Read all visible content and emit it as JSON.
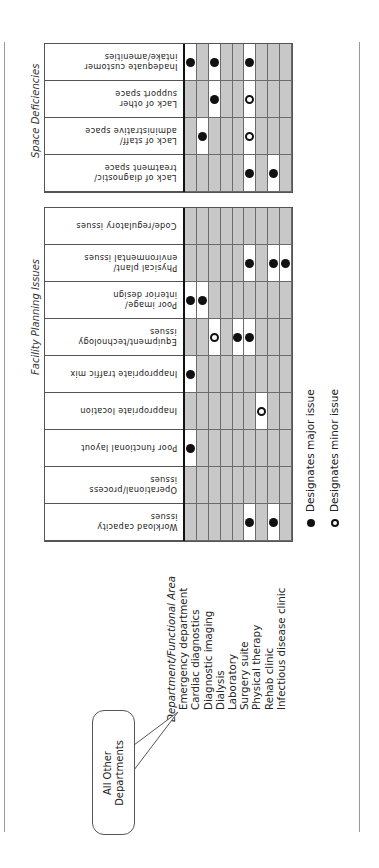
{
  "figure": {
    "dept_header": "Department/Functional Area",
    "departments": [
      "Emergency department",
      "Cardiac diagnostics",
      "Diagnostic imaging",
      "Dialysis",
      "Laboratory",
      "Surgery suite",
      "Physical therapy",
      "Rehab clinic",
      "Infectious disease clinic"
    ],
    "callout": "All Other\nDepartments",
    "legend": {
      "major": "Designates major issue",
      "minor": "Designates minor issue"
    },
    "colors": {
      "shaded": "#c8c8c8",
      "highlight": "#ffffff",
      "dot": "#111111"
    },
    "sections": [
      {
        "title": "Space Deficiencies",
        "rows": [
          {
            "label": "Inadequate customer\nintake/amenities",
            "cells": [
              "M",
              "",
              "M",
              "",
              "",
              "M",
              "",
              "",
              ""
            ]
          },
          {
            "label": "Lack of other\nsupport space",
            "cells": [
              "",
              "",
              "M",
              "",
              "",
              "m",
              "",
              "",
              ""
            ]
          },
          {
            "label": "Lack of staff/\nadministrative space",
            "cells": [
              "",
              "M",
              "",
              "",
              "",
              "m",
              "",
              "",
              ""
            ]
          },
          {
            "label": "Lack of diagnostic/\ntreatment space",
            "cells": [
              "",
              "",
              "",
              "",
              "",
              "M",
              "",
              "M",
              ""
            ]
          }
        ]
      },
      {
        "title": "Facility Planning Issues",
        "rows": [
          {
            "label": "Code/regulatory issues",
            "cells": [
              "",
              "",
              "",
              "",
              "",
              "",
              "",
              "",
              ""
            ]
          },
          {
            "label": "Physical plant/\nenvironmental issues",
            "cells": [
              "",
              "",
              "",
              "",
              "",
              "M",
              "",
              "M",
              "M"
            ]
          },
          {
            "label": "Poor image/\ninterior design",
            "cells": [
              "M",
              "M",
              "",
              "",
              "",
              "",
              "",
              "",
              ""
            ]
          },
          {
            "label": "Equipment/technology\nissues",
            "cells": [
              "",
              "",
              "m",
              "",
              "M",
              "M",
              "",
              "",
              ""
            ]
          },
          {
            "label": "Inappropriate traffic mix",
            "cells": [
              "M",
              "",
              "",
              "",
              "",
              "",
              "",
              "",
              ""
            ]
          },
          {
            "label": "Inappropriate location",
            "cells": [
              "",
              "",
              "",
              "",
              "",
              "",
              "m",
              "",
              ""
            ]
          },
          {
            "label": "Poor functional layout",
            "cells": [
              "M",
              "",
              "",
              "",
              "",
              "",
              "",
              "",
              ""
            ]
          },
          {
            "label": "Operational/process\nissues",
            "cells": [
              "",
              "",
              "",
              "",
              "",
              "",
              "",
              "",
              ""
            ]
          },
          {
            "label": "Workload capacity\nissues",
            "cells": [
              "",
              "",
              "",
              "",
              "",
              "M",
              "",
              "M",
              ""
            ]
          }
        ]
      }
    ]
  }
}
